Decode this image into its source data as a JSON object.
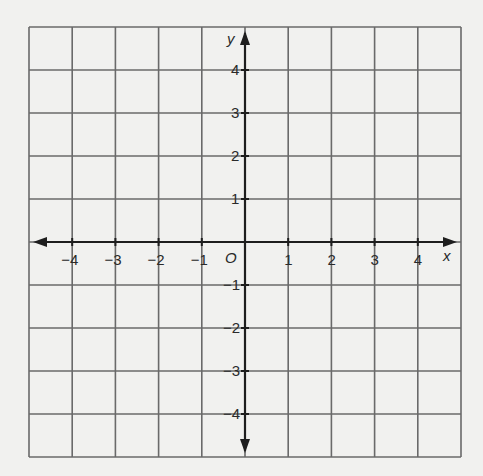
{
  "chart_data": {
    "type": "coordinate_grid",
    "title": "",
    "xlabel": "x",
    "ylabel": "y",
    "origin_label": "O",
    "xlim": [
      -5,
      5
    ],
    "ylim": [
      -5,
      5
    ],
    "grid": true,
    "grid_step": 1,
    "x_ticks": [
      -4,
      -3,
      -2,
      -1,
      1,
      2,
      3,
      4
    ],
    "y_ticks": [
      4,
      3,
      2,
      1,
      -1,
      -2,
      -3,
      -4
    ],
    "x_tick_labels": [
      "−4",
      "−3",
      "−2",
      "−1",
      "1",
      "2",
      "3",
      "4"
    ],
    "y_tick_labels": [
      "4",
      "3",
      "2",
      "1",
      "−1",
      "−2",
      "−3",
      "−4"
    ],
    "arrows": {
      "x_axis": "both",
      "y_axis": "both"
    }
  },
  "colors": {
    "background": "#f1f1ef",
    "grid": "#6a6a6a",
    "axis": "#1e1e1e",
    "text": "#2a2a2a"
  }
}
